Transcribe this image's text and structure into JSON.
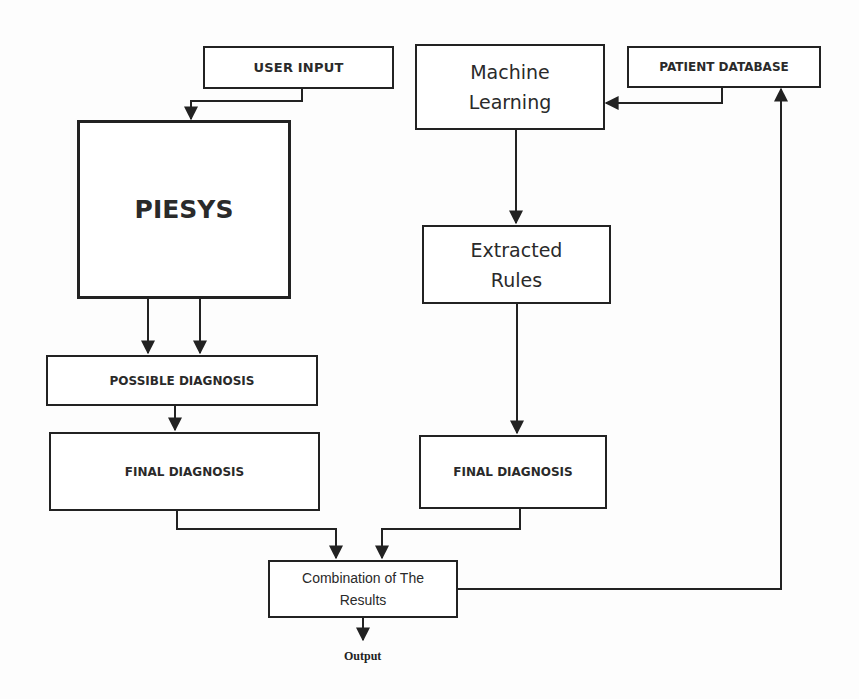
{
  "diagram": {
    "nodes": {
      "user_input": {
        "label": "USER INPUT"
      },
      "piesys": {
        "label": "PIESYS"
      },
      "machine_learning": {
        "line1": "Machine",
        "line2": "Learning"
      },
      "patient_database": {
        "label": "PATIENT DATABASE"
      },
      "extracted_rules": {
        "line1": "Extracted",
        "line2": "Rules"
      },
      "possible_diagnosis": {
        "label": "POSSIBLE DIAGNOSIS"
      },
      "final_diagnosis_left": {
        "label": "FINAL DIAGNOSIS"
      },
      "final_diagnosis_right": {
        "label": "FINAL DIAGNOSIS"
      },
      "combination": {
        "line1": "Combination of The",
        "line2": "Results"
      }
    },
    "output_label": "Output",
    "edges": [
      {
        "from": "USER INPUT",
        "to": "PIESYS"
      },
      {
        "from": "PATIENT DATABASE",
        "to": "Machine Learning"
      },
      {
        "from": "Machine Learning",
        "to": "Extracted Rules"
      },
      {
        "from": "PIESYS",
        "to": "POSSIBLE DIAGNOSIS",
        "count": 2
      },
      {
        "from": "POSSIBLE DIAGNOSIS",
        "to": "FINAL DIAGNOSIS (left)"
      },
      {
        "from": "Extracted Rules",
        "to": "FINAL DIAGNOSIS (right)"
      },
      {
        "from": "FINAL DIAGNOSIS (left)",
        "to": "Combination of The Results"
      },
      {
        "from": "FINAL DIAGNOSIS (right)",
        "to": "Combination of The Results"
      },
      {
        "from": "Combination of The Results",
        "to": "PATIENT DATABASE"
      },
      {
        "from": "Combination of The Results",
        "to": "Output"
      }
    ],
    "colors": {
      "line": "#222222",
      "text": "#2a2a2a",
      "background": "#fdfdfd"
    }
  }
}
